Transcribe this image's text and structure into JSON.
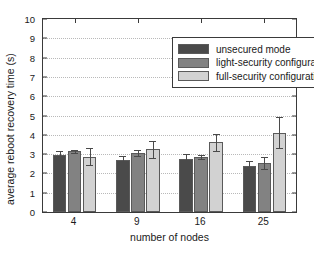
{
  "chart_data": {
    "type": "bar",
    "title": "",
    "xlabel": "number of nodes",
    "ylabel": "average reboot recovery time (s)",
    "categories": [
      "4",
      "9",
      "16",
      "25"
    ],
    "ylim": [
      0,
      10
    ],
    "yticks": [
      "0",
      "1",
      "2",
      "3",
      "4",
      "5",
      "6",
      "7",
      "8",
      "9",
      "10"
    ],
    "grid": true,
    "legend_position": "top-right",
    "series": [
      {
        "name": "unsecured mode",
        "color": "#4a4a4a",
        "values": [
          2.95,
          2.7,
          2.75,
          2.4
        ],
        "err_low": [
          0.2,
          0.18,
          0.28,
          0.2
        ],
        "err_high": [
          0.2,
          0.18,
          0.28,
          0.22
        ]
      },
      {
        "name": "light-security configuration",
        "color": "#828282",
        "values": [
          3.15,
          3.05,
          2.85,
          2.55
        ],
        "err_low": [
          0.1,
          0.16,
          0.12,
          0.3
        ],
        "err_high": [
          0.08,
          0.16,
          0.12,
          0.28
        ]
      },
      {
        "name": "full-security configuration",
        "color": "#d2d2d2",
        "values": [
          2.87,
          3.25,
          3.62,
          4.1
        ],
        "err_low": [
          0.45,
          0.45,
          0.45,
          0.8
        ],
        "err_high": [
          0.43,
          0.42,
          0.4,
          0.82
        ]
      }
    ]
  },
  "legend": {
    "items": [
      {
        "label": "unsecured mode"
      },
      {
        "label": "light-security configuration"
      },
      {
        "label": "full-security configuration"
      }
    ]
  },
  "axes": {
    "y_label": "average reboot recovery time (s)",
    "x_label": "number of nodes"
  }
}
